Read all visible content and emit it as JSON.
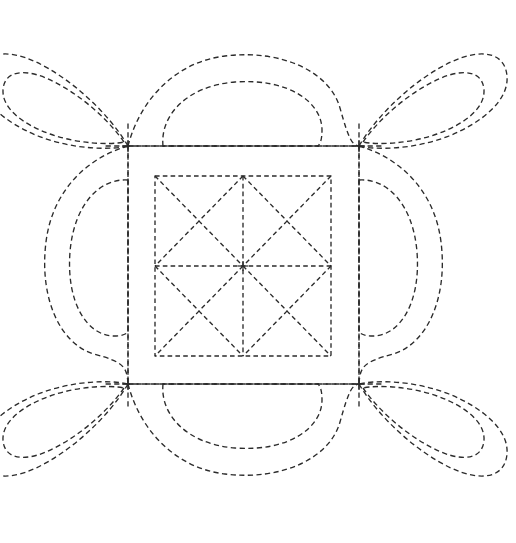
{
  "document": {
    "title": "Quilting Stencil Pattern",
    "kind": "line-art-diagram",
    "width": 516,
    "height": 543,
    "background_color": "#ffffff",
    "stroke_color": "#2b2b2b",
    "stroke_width": 1.35,
    "line_style": "dashed",
    "dash_pattern": "5.2 3.4"
  },
  "geometry": {
    "nodes": {
      "top_left": {
        "x": 128,
        "y": 146
      },
      "top_right": {
        "x": 359,
        "y": 146
      },
      "bottom_left": {
        "x": 128,
        "y": 384
      },
      "bottom_right": {
        "x": 359,
        "y": 384
      },
      "center": {
        "x": 243.5,
        "y": 265
      }
    },
    "outer_square": {
      "label": "outer-frame-square",
      "x": 128,
      "y": 146,
      "width": 231,
      "height": 238
    },
    "inner_square": {
      "label": "inner-grid-square",
      "x": 155,
      "y": 176,
      "width": 176,
      "height": 180
    },
    "inner_grid": {
      "center_vertical": {
        "x": 243,
        "y1": 176,
        "y2": 356
      },
      "center_horizontal": {
        "y": 266,
        "x1": 155,
        "x2": 331
      },
      "quadrant_diagonals": "each of the four quadrants of the inner square contains both diagonals forming an X"
    },
    "grid_stub_length": 18
  },
  "motifs": {
    "edge_petals": {
      "count": 4,
      "name": "edge-oval-petal",
      "description": "Rounded double-outline oval lobe centered on each side of the outer square, spanning node to node",
      "positions": [
        "top",
        "right",
        "bottom",
        "left"
      ],
      "outlines_per_petal": 2
    },
    "corner_petals": {
      "count": 4,
      "name": "corner-teardrop-petal",
      "description": "Elongated teardrop / leaf lobe radiating diagonally outward from each corner node, with a concentric inner teardrop",
      "positions": [
        "top-left",
        "top-right",
        "bottom-right",
        "bottom-left"
      ],
      "outlines_per_petal": 2
    },
    "total_petals": 8,
    "symmetry": "4-fold rotational and mirror symmetry about both axes"
  },
  "legend": {
    "visible": false,
    "items": []
  }
}
